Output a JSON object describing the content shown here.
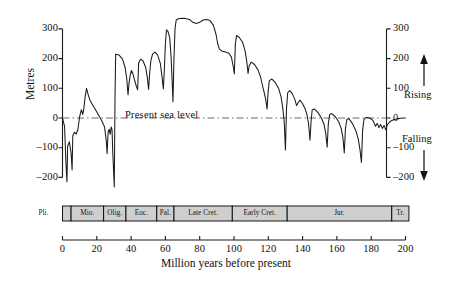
{
  "chart_data": {
    "type": "line",
    "title": "",
    "xlabel": "Million years before present",
    "ylabel": "Metres",
    "xlim": [
      0,
      200
    ],
    "ylim": [
      -230,
      340
    ],
    "x_ticks": [
      0,
      20,
      40,
      60,
      80,
      100,
      120,
      140,
      160,
      180,
      200
    ],
    "y_ticks": [
      -200,
      -100,
      0,
      100,
      200,
      300
    ],
    "x_tick_labels": [
      "0",
      "20",
      "40",
      "60",
      "80",
      "100",
      "120",
      "140",
      "160",
      "180",
      "200"
    ],
    "y_tick_labels": [
      "-200",
      "-100",
      "0",
      "100",
      "200",
      "300"
    ],
    "grid": false,
    "x_axis_direction": "increasing-left-to-right",
    "reference_line": {
      "value": 0,
      "label": "Present sea level",
      "style": "dash-dot"
    },
    "annotations": [
      {
        "text": "Rising",
        "position": "right-upper",
        "arrow": "up"
      },
      {
        "text": "Falling",
        "position": "right-lower",
        "arrow": "down"
      }
    ],
    "series": [
      {
        "name": "Global sea level",
        "points": [
          [
            0.0,
            0
          ],
          [
            1.2,
            -28
          ],
          [
            2.0,
            -150
          ],
          [
            2.6,
            -215
          ],
          [
            3.0,
            -95
          ],
          [
            4.0,
            -80
          ],
          [
            5.0,
            -118
          ],
          [
            5.6,
            -175
          ],
          [
            6.0,
            -60
          ],
          [
            7.0,
            -48
          ],
          [
            8.0,
            -54
          ],
          [
            9.0,
            -38
          ],
          [
            10.0,
            5
          ],
          [
            11.0,
            28
          ],
          [
            11.8,
            12
          ],
          [
            12.4,
            30
          ],
          [
            13.2,
            72
          ],
          [
            14.0,
            100
          ],
          [
            15.0,
            78
          ],
          [
            16.0,
            60
          ],
          [
            17.5,
            45
          ],
          [
            19.0,
            30
          ],
          [
            21.0,
            10
          ],
          [
            23.0,
            -10
          ],
          [
            24.5,
            -30
          ],
          [
            25.5,
            -75
          ],
          [
            26.0,
            -120
          ],
          [
            26.6,
            -48
          ],
          [
            27.2,
            -38
          ],
          [
            27.8,
            -55
          ],
          [
            28.4,
            -30
          ],
          [
            28.9,
            -40
          ],
          [
            29.3,
            -115
          ],
          [
            29.8,
            -180
          ],
          [
            30.2,
            -232
          ],
          [
            30.6,
            60
          ],
          [
            31.0,
            215
          ],
          [
            33.0,
            212
          ],
          [
            35.0,
            198
          ],
          [
            36.5,
            170
          ],
          [
            37.5,
            130
          ],
          [
            38.2,
            78
          ],
          [
            38.8,
            118
          ],
          [
            39.5,
            145
          ],
          [
            40.2,
            160
          ],
          [
            41.0,
            150
          ],
          [
            42.0,
            128
          ],
          [
            43.0,
            108
          ],
          [
            43.8,
            95
          ],
          [
            44.4,
            185
          ],
          [
            45.5,
            198
          ],
          [
            47.0,
            192
          ],
          [
            48.5,
            170
          ],
          [
            49.5,
            135
          ],
          [
            50.2,
            96
          ],
          [
            50.8,
            150
          ],
          [
            51.5,
            192
          ],
          [
            52.5,
            215
          ],
          [
            54.0,
            222
          ],
          [
            55.5,
            212
          ],
          [
            57.0,
            185
          ],
          [
            58.0,
            140
          ],
          [
            58.8,
            98
          ],
          [
            59.4,
            165
          ],
          [
            60.0,
            250
          ],
          [
            60.6,
            297
          ],
          [
            61.5,
            292
          ],
          [
            62.5,
            270
          ],
          [
            63.3,
            208
          ],
          [
            63.9,
            130
          ],
          [
            64.4,
            55
          ],
          [
            65.0,
            200
          ],
          [
            65.6,
            300
          ],
          [
            66.3,
            330
          ],
          [
            68.0,
            335
          ],
          [
            71.0,
            336
          ],
          [
            74.0,
            332
          ],
          [
            76.0,
            322
          ],
          [
            78.0,
            318
          ],
          [
            80.0,
            322
          ],
          [
            82.0,
            330
          ],
          [
            84.0,
            332
          ],
          [
            86.0,
            328
          ],
          [
            88.0,
            312
          ],
          [
            89.5,
            282
          ],
          [
            90.5,
            250
          ],
          [
            91.5,
            232
          ],
          [
            93.0,
            225
          ],
          [
            95.0,
            222
          ],
          [
            97.0,
            218
          ],
          [
            98.5,
            205
          ],
          [
            99.5,
            175
          ],
          [
            100.2,
            148
          ],
          [
            100.8,
            250
          ],
          [
            101.5,
            278
          ],
          [
            103.0,
            272
          ],
          [
            105.0,
            255
          ],
          [
            106.5,
            225
          ],
          [
            107.5,
            188
          ],
          [
            108.2,
            150
          ],
          [
            108.8,
            175
          ],
          [
            110.0,
            188
          ],
          [
            112.0,
            180
          ],
          [
            114.0,
            162
          ],
          [
            115.5,
            138
          ],
          [
            116.5,
            112
          ],
          [
            117.5,
            88
          ],
          [
            118.5,
            62
          ],
          [
            119.3,
            30
          ],
          [
            119.9,
            88
          ],
          [
            120.6,
            125
          ],
          [
            122.0,
            132
          ],
          [
            124.0,
            120
          ],
          [
            126.0,
            100
          ],
          [
            127.5,
            70
          ],
          [
            128.5,
            30
          ],
          [
            129.3,
            -15
          ],
          [
            130.0,
            -108
          ],
          [
            130.6,
            30
          ],
          [
            131.3,
            85
          ],
          [
            132.5,
            92
          ],
          [
            134.0,
            82
          ],
          [
            135.5,
            62
          ],
          [
            136.5,
            42
          ],
          [
            137.5,
            52
          ],
          [
            138.5,
            60
          ],
          [
            140.0,
            48
          ],
          [
            141.5,
            30
          ],
          [
            142.5,
            12
          ],
          [
            143.5,
            -20
          ],
          [
            144.3,
            -75
          ],
          [
            144.9,
            -15
          ],
          [
            145.6,
            28
          ],
          [
            147.0,
            30
          ],
          [
            149.0,
            18
          ],
          [
            151.0,
            0
          ],
          [
            152.5,
            -22
          ],
          [
            153.5,
            -52
          ],
          [
            154.3,
            -98
          ],
          [
            155.0,
            -20
          ],
          [
            155.8,
            12
          ],
          [
            157.0,
            15
          ],
          [
            159.0,
            5
          ],
          [
            161.0,
            -12
          ],
          [
            162.5,
            -35
          ],
          [
            163.5,
            -65
          ],
          [
            164.3,
            -118
          ],
          [
            165.0,
            -35
          ],
          [
            165.8,
            -5
          ],
          [
            167.0,
            -2
          ],
          [
            169.0,
            -18
          ],
          [
            171.0,
            -42
          ],
          [
            172.5,
            -72
          ],
          [
            173.5,
            -108
          ],
          [
            174.3,
            -150
          ],
          [
            175.0,
            -40
          ],
          [
            175.8,
            -5
          ],
          [
            177.0,
            2
          ],
          [
            179.0,
            0
          ],
          [
            181.0,
            -8
          ],
          [
            182.5,
            -28
          ],
          [
            183.5,
            -18
          ],
          [
            184.5,
            -32
          ],
          [
            185.5,
            -22
          ],
          [
            186.5,
            -35
          ],
          [
            187.5,
            -25
          ],
          [
            188.5,
            -40
          ],
          [
            189.5,
            -22
          ],
          [
            191.0,
            -12
          ],
          [
            193.0,
            -6
          ],
          [
            195.0,
            -3
          ],
          [
            197.0,
            -1
          ],
          [
            199.0,
            0
          ],
          [
            200.0,
            0
          ]
        ]
      }
    ],
    "period_bar": {
      "fill_color": "#cfcfcf",
      "border_color": "#000000",
      "cells": [
        {
          "label": "Pli.",
          "start": 0,
          "end": 5,
          "label_outside": true,
          "side": "left"
        },
        {
          "label": "",
          "start": 0,
          "end": 5,
          "label_outside": false
        },
        {
          "label": "Mio.",
          "start": 5,
          "end": 24
        },
        {
          "label": "Olig.",
          "start": 24,
          "end": 37
        },
        {
          "label": "Eoc.",
          "start": 37,
          "end": 55
        },
        {
          "label": "Pal.",
          "start": 55,
          "end": 65
        },
        {
          "label": "Late Cret.",
          "start": 65,
          "end": 99
        },
        {
          "label": "Early Cret.",
          "start": 99,
          "end": 131
        },
        {
          "label": "Jur.",
          "start": 131,
          "end": 192
        },
        {
          "label": "Tr.",
          "start": 192,
          "end": 202
        }
      ]
    }
  },
  "axis": {
    "y_label": "Metres",
    "x_label": "Million years before present",
    "sea_level_text": "Present sea level",
    "rising_text": "Rising",
    "falling_text": "Falling"
  }
}
